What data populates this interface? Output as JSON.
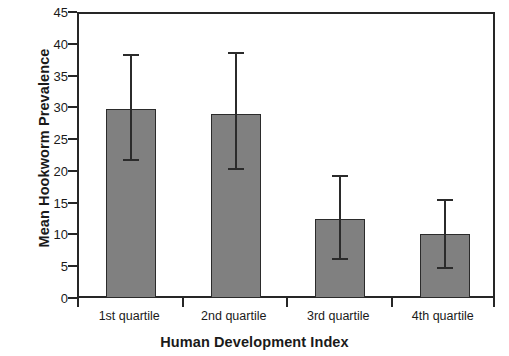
{
  "chart_data": {
    "type": "bar",
    "title": "",
    "xlabel": "Human Development Index",
    "ylabel": "Mean Hookworm Prevalence",
    "categories": [
      "1st quartile",
      "2nd quartile",
      "3rd quartile",
      "4th quartile"
    ],
    "values": [
      30.1,
      29.2,
      12.8,
      10.4
    ],
    "error_low": [
      22.0,
      20.6,
      6.4,
      5.0
    ],
    "error_high": [
      38.5,
      38.9,
      19.5,
      15.7
    ],
    "ylim": [
      0,
      45
    ],
    "ytick_labels": [
      "0",
      "5",
      "10",
      "15",
      "20",
      "25",
      "30",
      "35",
      "40",
      "45"
    ],
    "ytick_values": [
      0,
      5,
      10,
      15,
      20,
      25,
      30,
      35,
      40,
      45
    ],
    "grid": "off",
    "legend": "none",
    "bar_fill_color": "#808080",
    "bar_edge_color": "#2b2b2b",
    "axis_color": "#262626",
    "error_bar_color": "#2b2b2b",
    "background_color": "#ffffff"
  }
}
